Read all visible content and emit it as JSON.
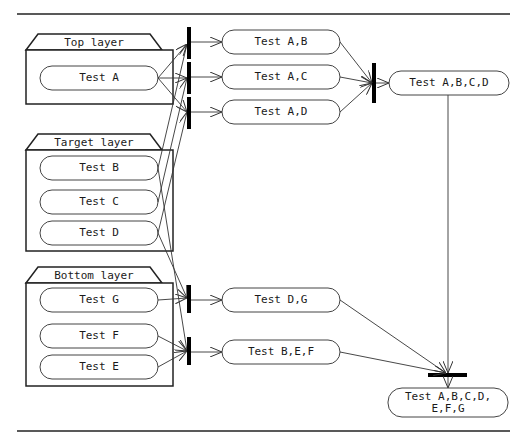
{
  "diagram": {
    "type": "activity-diagram",
    "layers": [
      {
        "id": "top",
        "title": "Top layer",
        "tests": [
          "Test A"
        ]
      },
      {
        "id": "target",
        "title": "Target layer",
        "tests": [
          "Test B",
          "Test C",
          "Test D"
        ]
      },
      {
        "id": "bottom",
        "title": "Bottom layer",
        "tests": [
          "Test G",
          "Test F",
          "Test E"
        ]
      }
    ],
    "pair_tests": [
      {
        "label": "Test A,B"
      },
      {
        "label": "Test A,C"
      },
      {
        "label": "Test A,D"
      },
      {
        "label": "Test D,G"
      },
      {
        "label": "Test B,E,F"
      }
    ],
    "merge_tests": [
      {
        "label": "Test A,B,C,D"
      },
      {
        "label": "Test A,B,C,D,\nE,F,G"
      }
    ],
    "colors": {
      "line": "#333333",
      "bar": "#000000",
      "background": "#ffffff"
    }
  }
}
